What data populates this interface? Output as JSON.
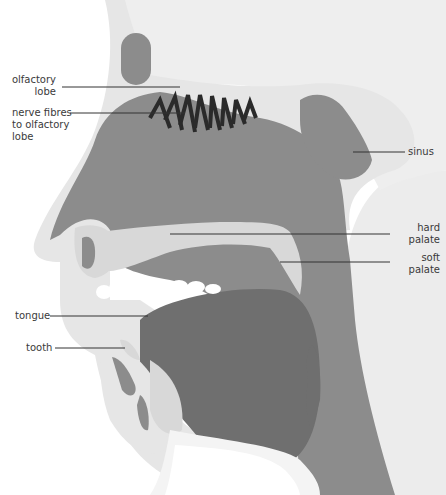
{
  "diagram": {
    "colors": {
      "background": "#ffffff",
      "skin_light": "#e6e6e6",
      "bone_light": "#d8d8d8",
      "cavity_mid": "#8c8c8c",
      "tongue_dark": "#6f6f6f",
      "texture_bg": "#ececec",
      "leader_line": "#333333",
      "teeth": "#ffffff",
      "nerve_stripes": "#2a2a2a"
    },
    "labels": [
      {
        "id": "olfactory-lobe",
        "text": "olfactory\nlobe",
        "align": "right"
      },
      {
        "id": "nerve-fibres",
        "text": "nerve fibres\nto olfactory\nlobe",
        "align": "left"
      },
      {
        "id": "sinus",
        "text": "sinus",
        "align": "left"
      },
      {
        "id": "hard-palate",
        "text": "hard\npalate",
        "align": "right"
      },
      {
        "id": "soft-palate",
        "text": "soft\npalate",
        "align": "right"
      },
      {
        "id": "tongue",
        "text": "tongue",
        "align": "left"
      },
      {
        "id": "tooth",
        "text": "tooth",
        "align": "left"
      }
    ]
  }
}
